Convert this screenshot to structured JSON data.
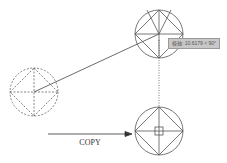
{
  "diagram": {
    "label": "COPY",
    "tooltip": "极轴: 10.6179 < 90°",
    "colors": {
      "line": "#555555",
      "background": "#ffffff",
      "tooltip_bg": "#c8c8c8"
    }
  }
}
